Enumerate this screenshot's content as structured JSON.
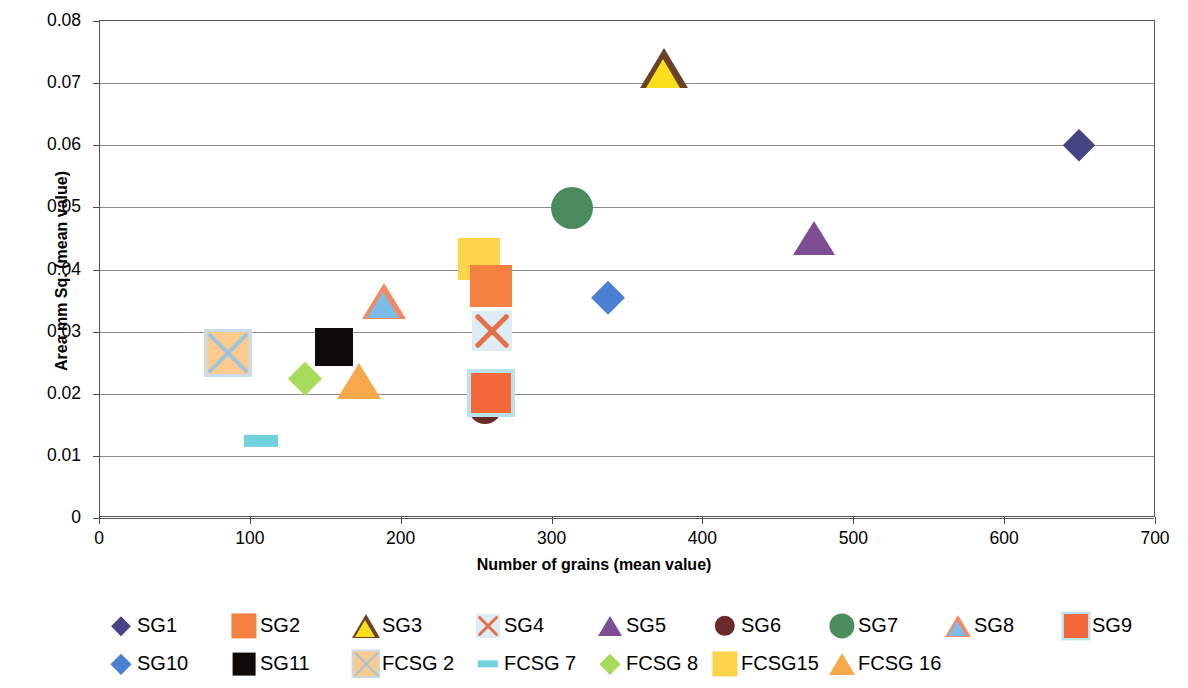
{
  "chart_data": {
    "type": "scatter",
    "title": "",
    "xlabel": "Number of grains (mean value)",
    "ylabel": "Area mm Sq. (mean value)",
    "xlim": [
      0,
      700
    ],
    "ylim": [
      0,
      0.08
    ],
    "xticks": [
      "0",
      "100",
      "200",
      "300",
      "400",
      "500",
      "600",
      "700"
    ],
    "xtick_values": [
      0,
      100,
      200,
      300,
      400,
      500,
      600,
      700
    ],
    "yticks": [
      "0",
      "0.01",
      "0.02",
      "0.03",
      "0.04",
      "0.05",
      "0.06",
      "0.07",
      "0.08"
    ],
    "ytick_values": [
      0,
      0.01,
      0.02,
      0.03,
      0.04,
      0.05,
      0.06,
      0.07,
      0.08
    ],
    "grid": "horizontal",
    "legend_position": "bottom",
    "series": [
      {
        "name": "SG1",
        "marker": "diamond",
        "color": "#474485",
        "border": "#474485",
        "size": 30,
        "x": 649,
        "y": 0.06
      },
      {
        "name": "SG2",
        "marker": "square",
        "color": "#F4813F",
        "border": "#F4813F",
        "size": 42,
        "x": 259,
        "y": 0.0374
      },
      {
        "name": "SG3",
        "marker": "triangle",
        "color": "#FAE01C",
        "border": "#6B4226",
        "size": 44,
        "x": 374,
        "y": 0.0724
      },
      {
        "name": "SG4",
        "marker": "x",
        "color": "#E2714A",
        "border": "#DCEEF4",
        "size": 40,
        "x": 260,
        "y": 0.0301
      },
      {
        "name": "SG5",
        "marker": "triangle",
        "color": "#7C4C94",
        "border": "#7C4C94",
        "size": 38,
        "x": 473,
        "y": 0.0451
      },
      {
        "name": "SG6",
        "marker": "circle",
        "color": "#6B2A2A",
        "border": "#6B2A2A",
        "size": 34,
        "x": 255,
        "y": 0.0178
      },
      {
        "name": "SG7",
        "marker": "circle",
        "color": "#4B8C5E",
        "border": "#4B8C5E",
        "size": 42,
        "x": 313,
        "y": 0.0499
      },
      {
        "name": "SG8",
        "marker": "triangle",
        "color": "#7BBDE8",
        "border": "#F08A63",
        "size": 40,
        "x": 188,
        "y": 0.035
      },
      {
        "name": "SG9",
        "marker": "square",
        "color": "#F4683C",
        "border": "#B6E3EC",
        "size": 40,
        "x": 259,
        "y": 0.0201
      },
      {
        "name": "SG10",
        "marker": "diamond",
        "color": "#4A7FD4",
        "border": "#4A7FD4",
        "size": 32,
        "x": 337,
        "y": 0.0354
      },
      {
        "name": "SG11",
        "marker": "square",
        "color": "#0D0A08",
        "border": "#0D0A08",
        "size": 38,
        "x": 155,
        "y": 0.0276
      },
      {
        "name": "FCSG 2",
        "marker": "square-x",
        "color": "#FBCB8E",
        "border": "#C9DCEE",
        "size": 42,
        "x": 85,
        "y": 0.0265
      },
      {
        "name": "FCSG 7",
        "marker": "dash",
        "color": "#6FD2DC",
        "border": "#6FD2DC",
        "size": 34,
        "x": 107,
        "y": 0.0124
      },
      {
        "name": "FCSG 8",
        "marker": "diamond",
        "color": "#A8DB5B",
        "border": "#A8DB5B",
        "size": 32,
        "x": 136,
        "y": 0.0223
      },
      {
        "name": "FCSG15",
        "marker": "square",
        "color": "#FBD44B",
        "border": "#FBD44B",
        "size": 42,
        "x": 251,
        "y": 0.0417
      },
      {
        "name": "FCSG 16",
        "marker": "triangle",
        "color": "#F7A84B",
        "border": "#F7A84B",
        "size": 40,
        "x": 172,
        "y": 0.022
      }
    ]
  },
  "legend": {
    "rows": [
      [
        {
          "label": "SG1",
          "series": 0
        },
        {
          "label": "SG2",
          "series": 1
        },
        {
          "label": "SG3",
          "series": 2
        },
        {
          "label": "SG4",
          "series": 3
        },
        {
          "label": "SG5",
          "series": 4
        },
        {
          "label": "SG6",
          "series": 5
        },
        {
          "label": "SG7",
          "series": 6
        },
        {
          "label": "SG8",
          "series": 7
        },
        {
          "label": "SG9",
          "series": 8
        }
      ],
      [
        {
          "label": "SG10",
          "series": 9
        },
        {
          "label": "SG11",
          "series": 10
        },
        {
          "label": "FCSG 2",
          "series": 11
        },
        {
          "label": "FCSG 7",
          "series": 12
        },
        {
          "label": "FCSG 8",
          "series": 13
        },
        {
          "label": "FCSG15",
          "series": 14
        },
        {
          "label": "FCSG 16",
          "series": 15
        }
      ]
    ],
    "row_positions": [
      [
        108,
        231,
        353,
        475,
        597,
        712,
        829,
        945,
        1063
      ],
      [
        108,
        231,
        353,
        475,
        597,
        712,
        829
      ]
    ]
  }
}
